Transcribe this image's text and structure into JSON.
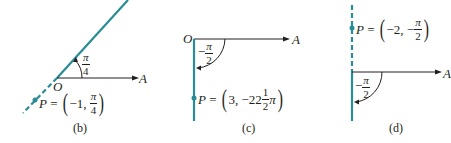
{
  "colors": {
    "ray": "#2a8c94",
    "axis": "#231f20",
    "text": "#231f20"
  },
  "panels": [
    {
      "id": "b",
      "caption": "(b)",
      "origin_label": "O",
      "axis_label": "A",
      "angle": {
        "sign": "",
        "num": "π",
        "den": "4"
      },
      "point": {
        "name": "P",
        "eq": "=",
        "r": "−1,",
        "theta_sign": "",
        "theta_num": "π",
        "theta_den": "4"
      }
    },
    {
      "id": "c",
      "caption": "(c)",
      "origin_label": "O",
      "axis_label": "A",
      "angle": {
        "sign": "−",
        "num": "π",
        "den": "2"
      },
      "point": {
        "name": "P",
        "eq": "=",
        "r": "3,",
        "theta_text": "−22",
        "theta_mixed_num": "1",
        "theta_mixed_den": "2",
        "theta_suffix": "π"
      }
    },
    {
      "id": "d",
      "caption": "(d)",
      "axis_label": "A",
      "angle": {
        "sign": "−",
        "num": "π",
        "den": "2"
      },
      "point": {
        "name": "P",
        "eq": "=",
        "r": "−2,",
        "theta_sign": "−",
        "theta_num": "π",
        "theta_den": "2"
      }
    }
  ]
}
